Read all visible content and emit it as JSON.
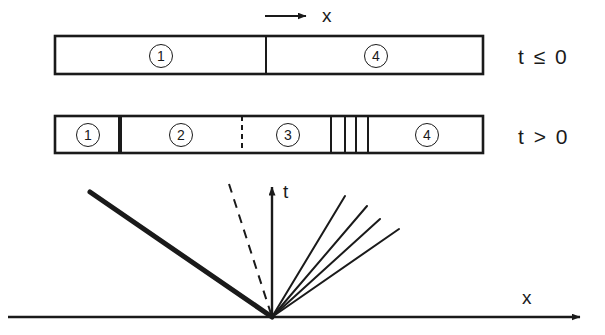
{
  "figure": {
    "title_semantic": "riemann-problem-wave-structure",
    "colors": {
      "ink": "#1a1a1a",
      "background": "#ffffff"
    },
    "top_axis": {
      "arrow_label": "x",
      "arrow_from_x": 265,
      "arrow_to_x": 312,
      "arrow_y": 16,
      "label_x": 322,
      "label_y": 6
    },
    "bar_initial": {
      "condition_label": "t ≤ 0",
      "condition_label_x": 518,
      "condition_label_y": 46,
      "x": 55,
      "y": 36,
      "width": 428,
      "height": 38,
      "dividers": [
        {
          "x": 266,
          "style": "solid",
          "weight": 2
        }
      ],
      "states": [
        {
          "label": "1",
          "center_x": 160,
          "center_y": 55
        },
        {
          "label": "4",
          "center_x": 375,
          "center_y": 55
        }
      ]
    },
    "bar_evolved": {
      "condition_label": "t > 0",
      "condition_label_x": 518,
      "condition_label_y": 126,
      "x": 55,
      "y": 116,
      "width": 428,
      "height": 37,
      "dividers": [
        {
          "x": 120,
          "style": "solid",
          "weight": 4
        },
        {
          "x": 242,
          "style": "dashed",
          "weight": 2
        },
        {
          "x": 331,
          "style": "solid",
          "weight": 2
        },
        {
          "x": 345,
          "style": "solid",
          "weight": 2
        },
        {
          "x": 356,
          "style": "solid",
          "weight": 2
        },
        {
          "x": 368,
          "style": "solid",
          "weight": 2
        }
      ],
      "states": [
        {
          "label": "1",
          "center_x": 87,
          "center_y": 134
        },
        {
          "label": "2",
          "center_x": 180,
          "center_y": 134
        },
        {
          "label": "3",
          "center_x": 287,
          "center_y": 134
        },
        {
          "label": "4",
          "center_x": 426,
          "center_y": 134
        }
      ]
    },
    "xt_diagram": {
      "origin": {
        "x": 272,
        "y": 317
      },
      "x_axis": {
        "label": "x",
        "from_x": 8,
        "to_x": 588,
        "y": 317,
        "label_x": 522,
        "label_y": 288
      },
      "t_axis": {
        "label": "t",
        "from_y": 317,
        "to_y": 180,
        "x": 272,
        "label_x": 283,
        "label_y": 182
      },
      "shock_line": {
        "name": "shock-wave",
        "from": {
          "x": 90,
          "y": 192
        },
        "to": {
          "x": 272,
          "y": 317
        },
        "weight": 5,
        "style": "solid"
      },
      "contact_line": {
        "name": "contact-discontinuity",
        "from": {
          "x": 229,
          "y": 184
        },
        "to": {
          "x": 272,
          "y": 317
        },
        "weight": 2,
        "style": "dashed"
      },
      "rarefaction_fan": {
        "name": "rarefaction-fan",
        "weight": 2,
        "rays": [
          {
            "x": 345,
            "y": 196
          },
          {
            "x": 367,
            "y": 206
          },
          {
            "x": 380,
            "y": 219
          },
          {
            "x": 399,
            "y": 229
          }
        ]
      }
    }
  }
}
